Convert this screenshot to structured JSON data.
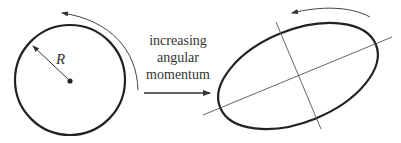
{
  "diagram": {
    "left": {
      "shape": "circle",
      "radius_label": "R",
      "rotation": "counterclockwise"
    },
    "middle": {
      "caption_lines": [
        "increasing",
        "angular",
        "momentum"
      ],
      "arrow": "right"
    },
    "right": {
      "shape": "ellipse",
      "axes": [
        "major-axis",
        "minor-axis"
      ],
      "rotation": "counterclockwise"
    },
    "colors": {
      "stroke": "#222222",
      "thin_stroke": "#555555",
      "background": "#ffffff"
    }
  }
}
